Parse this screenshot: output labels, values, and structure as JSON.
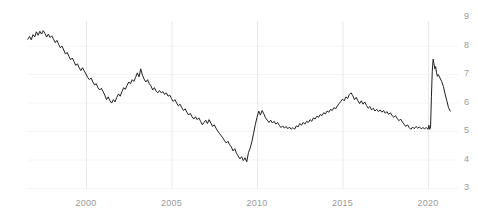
{
  "chart_data": {
    "type": "line",
    "title": "",
    "subtitle": "",
    "xlabel": "",
    "ylabel": "",
    "xlim": [
      1996.6,
      2021.4
    ],
    "ylim": [
      3,
      9
    ],
    "grid": "both-light",
    "legend": "none",
    "line_color": "#1f1f1f",
    "line_width": 1,
    "background_color": "#ffffff",
    "gridline_color": "#e9e9e9",
    "tick_label_color": "#9a9a9a",
    "y_ticks": [
      9,
      8,
      7,
      6,
      5,
      4,
      3
    ],
    "y_tick_labels": [
      "9",
      "8",
      "7",
      "6",
      "5",
      "4",
      "3"
    ],
    "x_ticks": [
      2000,
      2005,
      2010,
      2015,
      2020
    ],
    "x_tick_labels": [
      "2000",
      "2005",
      "2010",
      "2015",
      "2020"
    ],
    "series": [
      {
        "name": "series-1",
        "x": [
          1996.6,
          1996.7,
          1996.8,
          1996.9,
          1997.0,
          1997.1,
          1997.2,
          1997.3,
          1997.4,
          1997.5,
          1997.6,
          1997.7,
          1997.8,
          1997.9,
          1998.0,
          1998.1,
          1998.2,
          1998.3,
          1998.4,
          1998.5,
          1998.6,
          1998.7,
          1998.8,
          1998.9,
          1999.0,
          1999.1,
          1999.2,
          1999.3,
          1999.4,
          1999.5,
          1999.6,
          1999.7,
          1999.8,
          1999.9,
          2000.0,
          2000.1,
          2000.2,
          2000.3,
          2000.4,
          2000.5,
          2000.6,
          2000.7,
          2000.8,
          2000.9,
          2001.0,
          2001.1,
          2001.2,
          2001.3,
          2001.4,
          2001.5,
          2001.6,
          2001.7,
          2001.8,
          2001.9,
          2002.0,
          2002.1,
          2002.2,
          2002.3,
          2002.4,
          2002.5,
          2002.6,
          2002.7,
          2002.8,
          2002.9,
          2003.0,
          2003.1,
          2003.2,
          2003.3,
          2003.4,
          2003.5,
          2003.6,
          2003.7,
          2003.8,
          2003.9,
          2004.0,
          2004.1,
          2004.2,
          2004.3,
          2004.4,
          2004.5,
          2004.6,
          2004.7,
          2004.8,
          2004.9,
          2005.0,
          2005.1,
          2005.2,
          2005.3,
          2005.4,
          2005.5,
          2005.6,
          2005.7,
          2005.8,
          2005.9,
          2006.0,
          2006.1,
          2006.2,
          2006.3,
          2006.4,
          2006.5,
          2006.6,
          2006.7,
          2006.8,
          2006.9,
          2007.0,
          2007.1,
          2007.2,
          2007.3,
          2007.4,
          2007.5,
          2007.6,
          2007.7,
          2007.8,
          2007.9,
          2008.0,
          2008.1,
          2008.2,
          2008.3,
          2008.4,
          2008.5,
          2008.6,
          2008.7,
          2008.8,
          2008.9,
          2009.0,
          2009.1,
          2009.2,
          2009.3,
          2009.4,
          2009.5,
          2009.6,
          2009.7,
          2009.8,
          2009.9,
          2010.0,
          2010.1,
          2010.2,
          2010.3,
          2010.4,
          2010.5,
          2010.6,
          2010.7,
          2010.8,
          2010.9,
          2011.0,
          2011.1,
          2011.2,
          2011.3,
          2011.4,
          2011.5,
          2011.6,
          2011.7,
          2011.8,
          2011.9,
          2012.0,
          2012.1,
          2012.2,
          2012.3,
          2012.4,
          2012.5,
          2012.6,
          2012.7,
          2012.8,
          2012.9,
          2013.0,
          2013.1,
          2013.2,
          2013.3,
          2013.4,
          2013.5,
          2013.6,
          2013.7,
          2013.8,
          2013.9,
          2014.0,
          2014.1,
          2014.2,
          2014.3,
          2014.4,
          2014.5,
          2014.6,
          2014.7,
          2014.8,
          2014.9,
          2015.0,
          2015.1,
          2015.2,
          2015.3,
          2015.4,
          2015.5,
          2015.6,
          2015.7,
          2015.8,
          2015.9,
          2016.0,
          2016.1,
          2016.2,
          2016.3,
          2016.4,
          2016.5,
          2016.6,
          2016.7,
          2016.8,
          2016.9,
          2017.0,
          2017.1,
          2017.2,
          2017.3,
          2017.4,
          2017.5,
          2017.6,
          2017.7,
          2017.8,
          2017.9,
          2018.0,
          2018.1,
          2018.2,
          2018.3,
          2018.4,
          2018.5,
          2018.6,
          2018.7,
          2018.8,
          2018.9,
          2019.0,
          2019.1,
          2019.2,
          2019.3,
          2019.4,
          2019.5,
          2019.6,
          2019.7,
          2019.8,
          2019.9,
          2020.0,
          2020.05,
          2020.1,
          2020.15,
          2020.2,
          2020.25,
          2020.3,
          2020.35,
          2020.4,
          2020.45,
          2020.5,
          2020.55,
          2020.6,
          2020.7,
          2020.8,
          2020.9,
          2021.0,
          2021.1,
          2021.2,
          2021.3
        ],
        "y": [
          8.22,
          8.32,
          8.2,
          8.38,
          8.3,
          8.48,
          8.36,
          8.5,
          8.4,
          8.52,
          8.42,
          8.3,
          8.4,
          8.28,
          8.34,
          8.22,
          8.1,
          8.18,
          8.04,
          7.92,
          7.98,
          7.84,
          7.7,
          7.76,
          7.62,
          7.5,
          7.56,
          7.44,
          7.3,
          7.36,
          7.22,
          7.12,
          7.22,
          7.1,
          7.0,
          6.88,
          6.8,
          6.86,
          6.72,
          6.62,
          6.66,
          6.52,
          6.44,
          6.5,
          6.38,
          6.26,
          6.1,
          6.2,
          6.06,
          5.98,
          6.1,
          6.02,
          6.18,
          6.3,
          6.22,
          6.38,
          6.52,
          6.46,
          6.6,
          6.72,
          6.66,
          6.8,
          6.74,
          6.88,
          7.04,
          6.9,
          7.18,
          6.96,
          6.82,
          6.72,
          6.8,
          6.66,
          6.58,
          6.44,
          6.52,
          6.4,
          6.34,
          6.42,
          6.34,
          6.38,
          6.28,
          6.34,
          6.22,
          6.26,
          6.14,
          6.04,
          6.1,
          5.98,
          5.88,
          5.94,
          5.82,
          5.72,
          5.78,
          5.66,
          5.56,
          5.62,
          5.5,
          5.42,
          5.5,
          5.4,
          5.46,
          5.34,
          5.22,
          5.3,
          5.38,
          5.26,
          5.4,
          5.28,
          5.16,
          5.22,
          5.1,
          5.0,
          4.92,
          4.84,
          4.76,
          4.66,
          4.58,
          4.64,
          4.52,
          4.44,
          4.3,
          4.38,
          4.22,
          4.12,
          4.02,
          4.1,
          3.96,
          4.06,
          3.92,
          4.24,
          4.4,
          4.62,
          4.92,
          5.22,
          5.48,
          5.7,
          5.56,
          5.72,
          5.6,
          5.46,
          5.38,
          5.3,
          5.38,
          5.28,
          5.34,
          5.24,
          5.3,
          5.2,
          5.12,
          5.18,
          5.1,
          5.16,
          5.08,
          5.14,
          5.06,
          5.12,
          5.06,
          5.18,
          5.14,
          5.26,
          5.2,
          5.3,
          5.24,
          5.34,
          5.3,
          5.4,
          5.34,
          5.46,
          5.42,
          5.52,
          5.48,
          5.58,
          5.54,
          5.64,
          5.6,
          5.7,
          5.66,
          5.76,
          5.72,
          5.82,
          5.78,
          5.88,
          5.96,
          6.04,
          6.12,
          6.06,
          6.2,
          6.14,
          6.28,
          6.34,
          6.24,
          6.1,
          6.18,
          6.06,
          5.96,
          6.06,
          5.94,
          6.02,
          5.9,
          5.8,
          5.86,
          5.74,
          5.8,
          5.7,
          5.76,
          5.68,
          5.74,
          5.66,
          5.72,
          5.62,
          5.68,
          5.58,
          5.64,
          5.54,
          5.48,
          5.54,
          5.44,
          5.36,
          5.42,
          5.32,
          5.24,
          5.16,
          5.22,
          5.12,
          5.06,
          5.14,
          5.08,
          5.16,
          5.1,
          5.14,
          5.08,
          5.12,
          5.08,
          5.12,
          5.06,
          5.2,
          5.06,
          5.14,
          6.2,
          7.1,
          7.52,
          7.36,
          7.18,
          7.26,
          7.04,
          6.92,
          6.98,
          6.86,
          6.74,
          6.56,
          6.3,
          6.06,
          5.82,
          5.7
        ]
      }
    ]
  },
  "axes": {
    "y_labels": [
      "9",
      "8",
      "7",
      "6",
      "5",
      "4",
      "3"
    ],
    "x_labels": [
      "2000",
      "2005",
      "2010",
      "2015",
      "2020"
    ]
  }
}
